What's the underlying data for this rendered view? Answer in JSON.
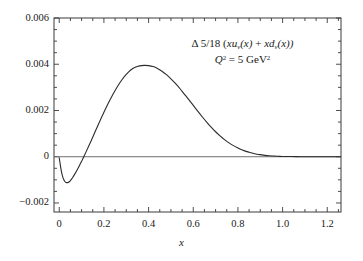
{
  "chart_data": {
    "type": "line",
    "title": "",
    "xlabel": "x",
    "ylabel": "",
    "xlim": [
      -0.0235,
      1.2615
    ],
    "ylim": [
      -0.00239,
      0.006
    ],
    "grid": false,
    "legend": "none",
    "annotations": [
      {
        "id": "distribution-label",
        "text": "Δ 5/18 (xuᵥ(x) + xdᵥ(x))",
        "x": 0.68,
        "y": 0.0052
      },
      {
        "id": "scale-label",
        "text": "Q² = 5 GeV²",
        "x": 0.68,
        "y": 0.0046
      }
    ],
    "xticks": [
      0,
      0.2,
      0.4,
      0.6,
      0.8,
      1.0,
      1.2
    ],
    "xticklabels": [
      "0",
      "0.2",
      "0.4",
      "0.6",
      "0.8",
      "1.0",
      "1.2"
    ],
    "xminor_step": 0.05,
    "yticks": [
      -0.002,
      0,
      0.002,
      0.004,
      0.006
    ],
    "yticklabels": [
      "−0.002",
      "0",
      "0.002",
      "0.004",
      "0.006"
    ],
    "yminor_step": 0.0005,
    "series": [
      {
        "name": "delta 5/18 (xu_v + xd_v)",
        "color": "#2b2b2b",
        "linewidth": 1.1,
        "x": [
          0.0,
          0.004,
          0.008,
          0.012,
          0.016,
          0.02,
          0.025,
          0.03,
          0.035,
          0.04,
          0.045,
          0.05,
          0.055,
          0.06,
          0.07,
          0.08,
          0.09,
          0.1,
          0.105,
          0.11,
          0.12,
          0.14,
          0.16,
          0.18,
          0.2,
          0.22,
          0.24,
          0.26,
          0.28,
          0.3,
          0.32,
          0.34,
          0.36,
          0.38,
          0.4,
          0.42,
          0.44,
          0.46,
          0.48,
          0.5,
          0.52,
          0.54,
          0.56,
          0.58,
          0.6,
          0.62,
          0.64,
          0.66,
          0.68,
          0.7,
          0.72,
          0.74,
          0.76,
          0.78,
          0.8,
          0.82,
          0.84,
          0.86,
          0.88,
          0.9,
          0.92,
          0.94,
          0.96,
          0.98,
          1.0,
          1.04,
          1.08,
          1.12,
          1.16,
          1.2,
          1.26
        ],
        "y": [
          -5e-05,
          -0.0003,
          -0.00055,
          -0.00074,
          -0.00088,
          -0.00098,
          -0.00107,
          -0.00111,
          -0.00112,
          -0.00111,
          -0.00108,
          -0.00103,
          -0.00097,
          -0.0009,
          -0.00074,
          -0.00057,
          -0.00039,
          -0.0002,
          -0.0001,
          0.0,
          0.00021,
          0.00063,
          0.00107,
          0.0015,
          0.00192,
          0.00232,
          0.00269,
          0.00303,
          0.00332,
          0.00356,
          0.00375,
          0.00387,
          0.00393,
          0.00395,
          0.00394,
          0.0039,
          0.00382,
          0.0037,
          0.00355,
          0.00337,
          0.00317,
          0.00295,
          0.00271,
          0.00247,
          0.00222,
          0.00197,
          0.00173,
          0.0015,
          0.00128,
          0.00108,
          0.0009,
          0.00074,
          0.0006,
          0.00048,
          0.00038,
          0.00029,
          0.00022,
          0.00017,
          0.00012,
          9e-05,
          6e-05,
          4e-05,
          3e-05,
          2e-05,
          1e-05,
          1e-05,
          0.0,
          0.0,
          0.0,
          0.0,
          0.0
        ]
      }
    ],
    "zero_line": {
      "y": 0,
      "color": "#6e6e6e"
    }
  },
  "axes": {
    "xtick_labels": [
      "0",
      "0.2",
      "0.4",
      "0.6",
      "0.8",
      "1.0",
      "1.2"
    ],
    "ytick_labels": [
      "0.006",
      "0.004",
      "0.002",
      "0",
      "−0.002"
    ],
    "xaxis_title": "x"
  },
  "annotation": {
    "line1_prefix": "Δ 5/18 (",
    "line1_term1_var": "xu",
    "line1_term1_sub": "v",
    "line1_term1_arg": "(x)",
    "line1_plus": " + ",
    "line1_term2_var": "xd",
    "line1_term2_sub": "v",
    "line1_term2_arg": "(x))",
    "line2_q": "Q",
    "line2_q_sup": "2",
    "line2_eq": " = 5 GeV",
    "line2_gev_sup": "2"
  }
}
